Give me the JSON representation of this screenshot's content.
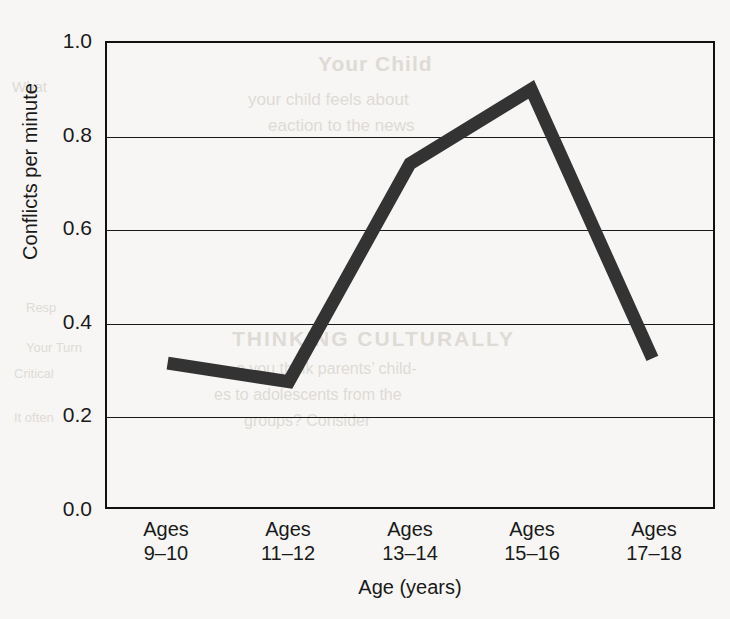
{
  "chart_data": {
    "type": "line",
    "title": "",
    "xlabel": "Age (years)",
    "ylabel": "Conflicts per minute",
    "categories": [
      "Ages 9–10",
      "Ages 11–12",
      "Ages 13–14",
      "Ages 15–16",
      "Ages 17–18"
    ],
    "category_lines": [
      [
        "Ages",
        "9–10"
      ],
      [
        "Ages",
        "11–12"
      ],
      [
        "Ages",
        "13–14"
      ],
      [
        "Ages",
        "15–16"
      ],
      [
        "Ages",
        "17–18"
      ]
    ],
    "values": [
      0.31,
      0.27,
      0.74,
      0.9,
      0.32
    ],
    "ylim": [
      0.0,
      1.0
    ],
    "yticks": [
      "0.0",
      "0.2",
      "0.4",
      "0.6",
      "0.8",
      "1.0"
    ],
    "ytick_values": [
      0.0,
      0.2,
      0.4,
      0.6,
      0.8,
      1.0
    ],
    "grid": "horizontal",
    "legend": "none",
    "line_color": "#333333",
    "line_width": 13,
    "axis_color": "#111111",
    "background_color": "#f7f6f4"
  },
  "bleed_text": {
    "t1": "Your Child",
    "t2": "your child feels about",
    "t3": "eaction to the news",
    "t4": "THINKING CULTURALLY",
    "t5": "o you think parents’ child-",
    "t6": "es to adolescents from the",
    "t7": "groups? Consider",
    "t8": "Resp",
    "t9": "Your Turn",
    "t10": "Critical",
    "t11": "It often",
    "t12": "What"
  }
}
